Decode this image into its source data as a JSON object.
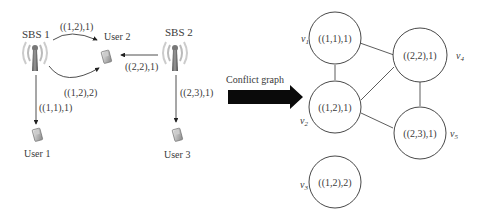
{
  "network": {
    "base_stations": [
      {
        "id": "sbs1",
        "label": "SBS 1"
      },
      {
        "id": "sbs2",
        "label": "SBS 2"
      }
    ],
    "users": [
      {
        "id": "user1",
        "label": "User 1"
      },
      {
        "id": "user2",
        "label": "User 2"
      },
      {
        "id": "user3",
        "label": "User 3"
      }
    ],
    "links": [
      {
        "from": "SBS 1",
        "to": "User 2",
        "label": "((1,2),1)"
      },
      {
        "from": "SBS 1",
        "to": "User 2",
        "label": "((1,2),2)"
      },
      {
        "from": "SBS 1",
        "to": "User 1",
        "label": "((1,1),1)"
      },
      {
        "from": "SBS 2",
        "to": "User 2",
        "label": "((2,2),1)"
      },
      {
        "from": "SBS 2",
        "to": "User 3",
        "label": "((2,3),1)"
      }
    ]
  },
  "arrow": {
    "label": "Conflict graph"
  },
  "graph": {
    "vertices": [
      {
        "name": "v",
        "sub": "1",
        "label": "((1,1),1)"
      },
      {
        "name": "v",
        "sub": "2",
        "label": "((1,2),1)"
      },
      {
        "name": "v",
        "sub": "3",
        "label": "((1,2),2)"
      },
      {
        "name": "v",
        "sub": "4",
        "label": "((2,2),1)"
      },
      {
        "name": "v",
        "sub": "5",
        "label": "((2,3),1)"
      }
    ],
    "edges": [
      [
        "v1",
        "v4"
      ],
      [
        "v1",
        "v2"
      ],
      [
        "v2",
        "v4"
      ],
      [
        "v4",
        "v5"
      ],
      [
        "v2",
        "v5"
      ]
    ]
  }
}
